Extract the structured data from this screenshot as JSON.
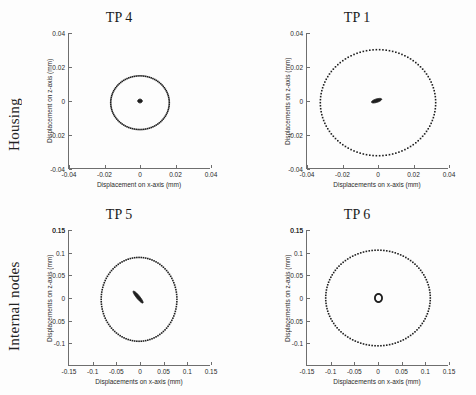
{
  "figure": {
    "row_labels": [
      {
        "id": "housing",
        "text": "Housing"
      },
      {
        "id": "internal-nodes",
        "text": "Internal nodes"
      }
    ]
  },
  "chart_data": [
    {
      "id": "tp4",
      "type": "scatter",
      "title": "TP 4",
      "xlabel": "Displacement on x-axis (mm)",
      "ylabel": "Displacement on z-axis (mm)",
      "xlim": [
        -0.04,
        0.04
      ],
      "ylim": [
        -0.04,
        0.04
      ],
      "xticks": [
        -0.04,
        -0.02,
        0,
        0.02,
        0.04
      ],
      "xticklabels": [
        "-0.04",
        "-0.02",
        "0",
        "0.02",
        "0.04"
      ],
      "yticks": [
        -0.04,
        -0.02,
        0,
        0.02,
        0.04
      ],
      "yticklabels": [
        "-0.04",
        "-0.02",
        "0",
        "0.02",
        "0.04"
      ],
      "grid": false,
      "legend": "none",
      "series": [
        {
          "name": "outer orbit",
          "shape": "ellipse",
          "marker": "dotted",
          "center": [
            0.0,
            -0.001
          ],
          "semi_axis_x": 0.0165,
          "semi_axis_y": 0.0158,
          "rotation_deg": 0,
          "n_points": 96
        },
        {
          "name": "inner orbit",
          "shape": "ellipse",
          "marker": "filled",
          "center": [
            0.0,
            0.0
          ],
          "semi_axis_x": 0.0013,
          "semi_axis_y": 0.0011,
          "rotation_deg": 0,
          "n_points": 60
        }
      ]
    },
    {
      "id": "tp1",
      "type": "scatter",
      "title": "TP 1",
      "xlabel": "Displacements on x-axis (mm)",
      "ylabel": "Displacements on z-axis (mm)",
      "xlim": [
        -0.04,
        0.04
      ],
      "ylim": [
        -0.04,
        0.04
      ],
      "xticks": [
        -0.04,
        -0.02,
        0,
        0.02,
        0.04
      ],
      "xticklabels": [
        "-0.04",
        "-0.02",
        "0",
        "0.02",
        "0.04"
      ],
      "yticks": [
        -0.04,
        -0.02,
        0,
        0.02,
        0.04
      ],
      "yticklabels": [
        "-0.04",
        "-0.02",
        "0",
        "0.02",
        "0.04"
      ],
      "grid": false,
      "legend": "none",
      "series": [
        {
          "name": "outer orbit",
          "shape": "ellipse",
          "marker": "dotted",
          "center": [
            0.0,
            -0.001
          ],
          "semi_axis_x": 0.0325,
          "semi_axis_y": 0.0312,
          "rotation_deg": 0,
          "n_points": 110
        },
        {
          "name": "inner orbit",
          "shape": "ellipse",
          "marker": "filled",
          "center": [
            -0.0008,
            0.0002
          ],
          "semi_axis_x": 0.003,
          "semi_axis_y": 0.001,
          "rotation_deg": 18,
          "n_points": 60
        }
      ]
    },
    {
      "id": "tp5",
      "type": "scatter",
      "title": "TP 5",
      "xlabel": "Displacements on x-axis (mm)",
      "ylabel": "Displacements on z-axis (mm)",
      "xlim": [
        -0.15,
        0.15
      ],
      "ylim": [
        -0.15,
        0.15
      ],
      "xticks": [
        -0.1,
        -0.05,
        0,
        0.05,
        0.1,
        0.15
      ],
      "xticklabels": [
        "-0.1",
        "-0.05",
        "0",
        "0.05",
        "0.1",
        "0.15"
      ],
      "yticks": [
        -0.1,
        -0.05,
        0,
        0.05,
        0.1,
        0.15
      ],
      "yticklabels": [
        "-0.1",
        "-0.05",
        "0",
        "0.05",
        "0.1",
        "0.15"
      ],
      "grid": false,
      "legend": "none",
      "series": [
        {
          "name": "outer orbit",
          "shape": "ellipse",
          "marker": "dotted",
          "center": [
            -0.002,
            -0.003
          ],
          "semi_axis_x": 0.08,
          "semi_axis_y": 0.0925,
          "rotation_deg": 0,
          "n_points": 108
        },
        {
          "name": "inner orbit",
          "shape": "line",
          "marker": "filled",
          "center": [
            -0.004,
            0.002
          ],
          "semi_axis_x": 0.0165,
          "semi_axis_y": 0.0035,
          "rotation_deg": -52,
          "n_points": 60
        }
      ]
    },
    {
      "id": "tp6",
      "type": "scatter",
      "title": "TP 6",
      "xlabel": "Displacements on x-axis (mm)",
      "ylabel": "Displacements on z-axis (mm)",
      "xlim": [
        -0.15,
        0.15
      ],
      "ylim": [
        -0.15,
        0.15
      ],
      "xticks": [
        -0.1,
        -0.05,
        0,
        0.05,
        0.1,
        0.15
      ],
      "xticklabels": [
        "-0.1",
        "-0.05",
        "0",
        "0.05",
        "0.1",
        "0.15"
      ],
      "yticks": [
        -0.1,
        -0.05,
        0,
        0.05,
        0.1,
        0.15
      ],
      "yticklabels": [
        "-0.1",
        "-0.05",
        "0",
        "0.05",
        "0.1",
        "0.15"
      ],
      "grid": false,
      "legend": "none",
      "series": [
        {
          "name": "outer orbit",
          "shape": "ellipse",
          "marker": "dotted",
          "center": [
            0.0,
            0.0
          ],
          "semi_axis_x": 0.1105,
          "semi_axis_y": 0.1055,
          "rotation_deg": 0,
          "n_points": 112
        },
        {
          "name": "inner orbit",
          "shape": "ring",
          "marker": "dotted",
          "center": [
            0.001,
            0.0
          ],
          "semi_axis_x": 0.0075,
          "semi_axis_y": 0.009,
          "rotation_deg": 0,
          "n_points": 34
        }
      ]
    }
  ],
  "colors": {
    "marker": "#1f1f1f",
    "axis": "#6e6e6e",
    "text": "#1a1a1a",
    "background": "#fdfdfd"
  }
}
